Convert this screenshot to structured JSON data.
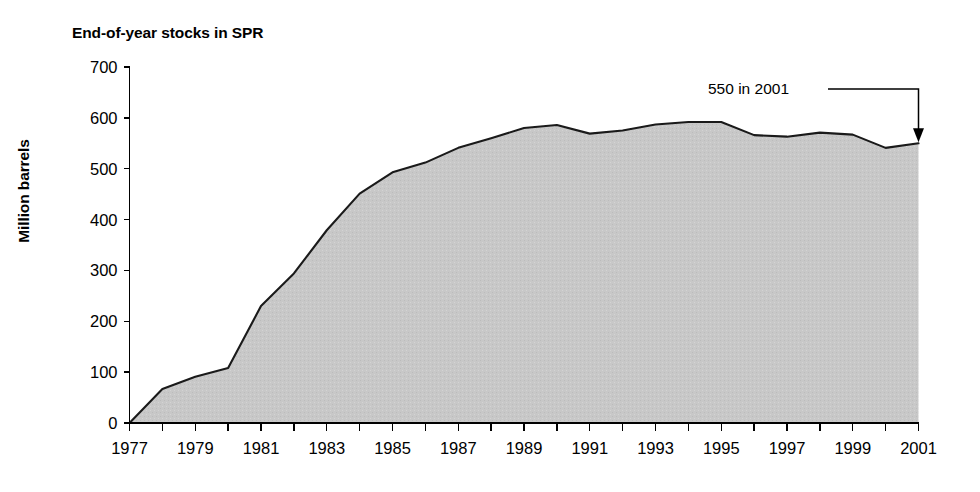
{
  "chart_data": {
    "type": "area",
    "title": "End-of-year stocks in SPR",
    "xlabel": "",
    "ylabel": "Million barrels",
    "xlim": [
      1977,
      2001
    ],
    "ylim": [
      0,
      700
    ],
    "grid": false,
    "legend": "none",
    "fill_color": "#c8c8c8",
    "line_color": "#1a1a1a",
    "x": [
      1977,
      1978,
      1979,
      1980,
      1981,
      1982,
      1983,
      1984,
      1985,
      1986,
      1987,
      1988,
      1989,
      1990,
      1991,
      1992,
      1993,
      1994,
      1995,
      1996,
      1997,
      1998,
      1999,
      2000,
      2001
    ],
    "values": [
      0,
      67,
      91,
      108,
      230,
      294,
      379,
      451,
      493,
      512,
      541,
      560,
      580,
      586,
      569,
      575,
      587,
      592,
      592,
      566,
      563,
      571,
      567,
      541,
      550
    ],
    "y_ticks": [
      0,
      100,
      200,
      300,
      400,
      500,
      600,
      700
    ],
    "y_tick_labels": [
      "0",
      "100",
      "200",
      "300",
      "400",
      "500",
      "600",
      "700"
    ],
    "x_ticks": [
      1977,
      1978,
      1979,
      1980,
      1981,
      1982,
      1983,
      1984,
      1985,
      1986,
      1987,
      1988,
      1989,
      1990,
      1991,
      1992,
      1993,
      1994,
      1995,
      1996,
      1997,
      1998,
      1999,
      2000,
      2001
    ],
    "x_tick_labels": [
      "1977",
      "",
      "1979",
      "",
      "1981",
      "",
      "1983",
      "",
      "1985",
      "",
      "1987",
      "",
      "1989",
      "",
      "1991",
      "",
      "1993",
      "",
      "1995",
      "",
      "1997",
      "",
      "1999",
      "",
      "2001"
    ],
    "annotations": [
      {
        "text": "550 in 2001",
        "target_x": 2001,
        "target_y": 550,
        "arrow": "down"
      }
    ]
  }
}
